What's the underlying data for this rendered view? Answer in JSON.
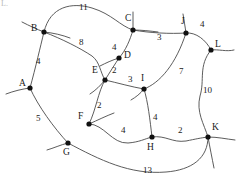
{
  "figure": {
    "type": "weighted-graph-diagram",
    "corner_artifact": "L.",
    "stroke_color": "#4a4a4a",
    "node_color": "#111111",
    "background": "#ffffff",
    "width": 237,
    "height": 183
  },
  "nodes": [
    {
      "id": "A",
      "label": "A",
      "x": 30,
      "y": 88,
      "label_x": 19,
      "label_y": 79
    },
    {
      "id": "B",
      "label": "B",
      "x": 44,
      "y": 32,
      "label_x": 31,
      "label_y": 24
    },
    {
      "id": "C",
      "label": "C",
      "x": 133,
      "y": 30,
      "label_x": 125,
      "label_y": 14
    },
    {
      "id": "D",
      "label": "D",
      "x": 119,
      "y": 58,
      "label_x": 124,
      "label_y": 51
    },
    {
      "id": "E",
      "label": "E",
      "x": 105,
      "y": 80,
      "label_x": 92,
      "label_y": 66
    },
    {
      "id": "F",
      "label": "F",
      "x": 89,
      "y": 124,
      "label_x": 78,
      "label_y": 112
    },
    {
      "id": "G",
      "label": "G",
      "x": 68,
      "y": 143,
      "label_x": 63,
      "label_y": 148
    },
    {
      "id": "H",
      "label": "H",
      "x": 152,
      "y": 137,
      "label_x": 147,
      "label_y": 143
    },
    {
      "id": "I",
      "label": "I",
      "x": 144,
      "y": 89,
      "label_x": 141,
      "label_y": 74
    },
    {
      "id": "J",
      "label": "J",
      "x": 186,
      "y": 33,
      "label_x": 181,
      "label_y": 17
    },
    {
      "id": "K",
      "label": "K",
      "x": 208,
      "y": 137,
      "label_x": 212,
      "label_y": 123
    },
    {
      "id": "L",
      "label": "L",
      "x": 211,
      "y": 50,
      "label_x": 215,
      "label_y": 40
    }
  ],
  "edges": [
    {
      "from": "B",
      "to": "C",
      "weight": "11",
      "label_x": 79,
      "label_y": 3,
      "path": "M 44,32 C 50,6 72,2 92,8 C 112,14 120,26 133,30"
    },
    {
      "from": "B",
      "to": "E",
      "weight": "8",
      "label_x": 79,
      "label_y": 38,
      "path": "M 44,32 C 62,39 80,48 92,56 C 100,62 100,72 105,80"
    },
    {
      "from": "A",
      "to": "B",
      "weight": "4",
      "label_x": 36,
      "label_y": 57,
      "path": "M 44,32 C 40,48 36,66 30,88"
    },
    {
      "from": "A",
      "to": "G",
      "weight": "5",
      "label_x": 36,
      "label_y": 114,
      "path": "M 30,88 C 38,106 54,128 68,143"
    },
    {
      "from": "C",
      "to": "D",
      "weight": "4",
      "label_x": 112,
      "label_y": 43,
      "path": "M 133,30 C 130,40 126,50 119,58"
    },
    {
      "from": "C",
      "to": "J",
      "weight": "3",
      "label_x": 157,
      "label_y": 33,
      "path": "M 133,30 C 150,33 170,34 186,33"
    },
    {
      "from": "D",
      "to": "E",
      "weight": "2",
      "label_x": 112,
      "label_y": 66,
      "path": "M 119,58 C 115,64 110,72 105,80"
    },
    {
      "from": "E",
      "to": "I",
      "weight": "3",
      "label_x": 128,
      "label_y": 75,
      "path": "M 105,80 C 118,83 132,87 144,89"
    },
    {
      "from": "E",
      "to": "F",
      "weight": "2",
      "label_x": 97,
      "label_y": 101,
      "path": "M 105,80 C 98,92 96,110 89,124"
    },
    {
      "from": "F",
      "to": "H",
      "weight": "4",
      "label_x": 121,
      "label_y": 126,
      "path": "M 89,124 C 104,124 112,144 128,143 C 140,142 144,139 152,137"
    },
    {
      "from": "I",
      "to": "H",
      "weight": "4",
      "label_x": 153,
      "label_y": 113,
      "path": "M 144,89 C 148,102 150,120 152,137"
    },
    {
      "from": "H",
      "to": "K",
      "weight": "2",
      "label_x": 178,
      "label_y": 126,
      "path": "M 152,137 C 166,135 172,143 186,141 C 196,139 200,138 208,137"
    },
    {
      "from": "I",
      "to": "J",
      "weight": "7",
      "label_x": 179,
      "label_y": 67,
      "path": "M 144,89 C 160,83 176,64 186,33"
    },
    {
      "from": "J",
      "to": "L",
      "weight": "4",
      "label_x": 200,
      "label_y": 20,
      "path": "M 186,33 C 196,32 206,40 211,50"
    },
    {
      "from": "L",
      "to": "K",
      "weight": "10",
      "label_x": 203,
      "label_y": 86,
      "path": "M 211,50 C 198,66 205,80 200,96 C 196,112 204,124 208,137"
    },
    {
      "from": "G",
      "to": "K",
      "weight": "13",
      "label_x": 143,
      "label_y": 166,
      "path": "M 68,143 C 100,160 130,175 166,172 C 192,170 208,158 208,137"
    }
  ],
  "open_stubs": [
    {
      "name": "stub-a-left",
      "path": "M 30,88 C 22,89 14,91 6,94"
    },
    {
      "name": "stub-b-upleft",
      "path": "M 44,32 C 36,29 30,26 22,22"
    },
    {
      "name": "stub-b-right",
      "path": "M 44,32 C 54,33 62,35 70,38"
    },
    {
      "name": "stub-c-up",
      "path": "M 133,30 C 133,24 133,18 133,12"
    },
    {
      "name": "stub-c-right",
      "path": "M 133,30 C 142,30 150,31 158,32"
    },
    {
      "name": "stub-j-up",
      "path": "M 186,33 C 185,26 184,20 183,14"
    },
    {
      "name": "stub-l-right",
      "path": "M 211,50 C 219,49 226,52 234,50"
    },
    {
      "name": "stub-k-right",
      "path": "M 208,137 C 218,137 226,139 235,140"
    },
    {
      "name": "stub-k-down",
      "path": "M 208,137 C 210,148 212,158 214,168"
    },
    {
      "name": "stub-g-left",
      "path": "M 68,143 C 60,145 54,148 47,150"
    },
    {
      "name": "stub-f-right",
      "path": "M 89,124 C 98,120 106,116 114,113"
    },
    {
      "name": "stub-e-down",
      "path": "M 105,80 C 100,86 96,90 90,94"
    },
    {
      "name": "stub-i-down",
      "path": "M 144,89 C 140,94 136,97 131,100"
    },
    {
      "name": "stub-d-left",
      "path": "M 119,58 C 112,60 106,63 100,66"
    }
  ]
}
